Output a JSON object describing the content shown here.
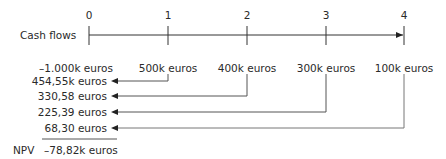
{
  "timeline": {
    "row_label": "Cash flows",
    "periods": [
      "0",
      "1",
      "2",
      "3",
      "4"
    ],
    "cash_flows": [
      "–1.000k euros",
      "500k euros",
      "400k euros",
      "300k euros",
      "100k euros"
    ]
  },
  "discounted_values": [
    {
      "from_period": "1",
      "value": "454,55k euros"
    },
    {
      "from_period": "2",
      "value": "330,58 euros"
    },
    {
      "from_period": "3",
      "value": "225,39 euros"
    },
    {
      "from_period": "4",
      "value": "68,30 euros"
    }
  ],
  "npv": {
    "label": "NPV",
    "value": "–78,82k euros"
  },
  "colors": {
    "text": "#2a2a2a",
    "axis": "#333333",
    "connector": "#777777"
  }
}
